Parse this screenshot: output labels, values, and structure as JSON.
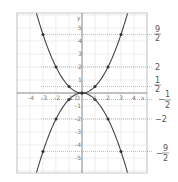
{
  "chart_data": {
    "type": "line",
    "title": "",
    "xlabel": "x",
    "ylabel": "y",
    "xlim": [
      -5,
      5
    ],
    "ylim": [
      -6,
      6
    ],
    "grid": true,
    "x_ticks": [
      "-4",
      "-3",
      "-2",
      "-1",
      "O",
      "1",
      "2",
      "3",
      "4"
    ],
    "y_ticks": [
      "5",
      "4",
      "3",
      "2",
      "1",
      "-1",
      "-2",
      "-3",
      "-4",
      "-5"
    ],
    "series": [
      {
        "name": "y = x^2/2",
        "x": [
          -3,
          -2,
          -1,
          0,
          1,
          2,
          3
        ],
        "values": [
          4.5,
          2,
          0.5,
          0,
          0.5,
          2,
          4.5
        ]
      },
      {
        "name": "y = -x^2/2",
        "x": [
          -3,
          -2,
          -1,
          0,
          1,
          2,
          3
        ],
        "values": [
          -4.5,
          -2,
          -0.5,
          0,
          -0.5,
          -2,
          -4.5
        ]
      }
    ],
    "annotations": [
      {
        "num": "9",
        "den": "2",
        "sign": "",
        "y": 4.5
      },
      {
        "num": "",
        "den": "",
        "text": "2",
        "y": 2
      },
      {
        "num": "1",
        "den": "2",
        "sign": "",
        "y": 0.5
      },
      {
        "num": "1",
        "den": "2",
        "sign": "-",
        "y": -0.5
      },
      {
        "num": "",
        "den": "",
        "text": "-2",
        "y": -2
      },
      {
        "num": "9",
        "den": "2",
        "sign": "-",
        "y": -4.5
      }
    ]
  },
  "labels": {
    "x_axis": "x",
    "y_axis": "y",
    "origin": "O",
    "r1n": "9",
    "r1d": "2",
    "r2": "2",
    "r3n": "1",
    "r3d": "2",
    "r4s": "−",
    "r4n": "1",
    "r4d": "2",
    "r5": "−2",
    "r6s": "−",
    "r6n": "9",
    "r6d": "2"
  }
}
